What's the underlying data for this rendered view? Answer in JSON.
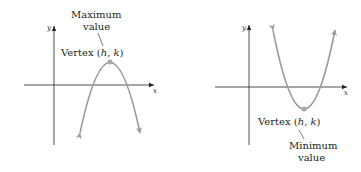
{
  "colors": {
    "axis": "#231f20",
    "curve": "#9a9a9a",
    "vertex": "#a8a8a8",
    "text": "#231f20"
  },
  "left_graph": {
    "x_axis_label": "x",
    "y_axis_label": "y",
    "vertex_label_prefix": "Vertex (",
    "vertex_h": "h",
    "vertex_sep": ", ",
    "vertex_k": "k",
    "vertex_label_suffix": ")",
    "annotation_line1": "Maximum",
    "annotation_line2": "value",
    "opens": "down"
  },
  "right_graph": {
    "x_axis_label": "x",
    "y_axis_label": "y",
    "vertex_label_prefix": "Vertex (",
    "vertex_h": "h",
    "vertex_sep": ", ",
    "vertex_k": "k",
    "vertex_label_suffix": ")",
    "annotation_line1": "Minimum",
    "annotation_line2": "value",
    "opens": "up"
  }
}
